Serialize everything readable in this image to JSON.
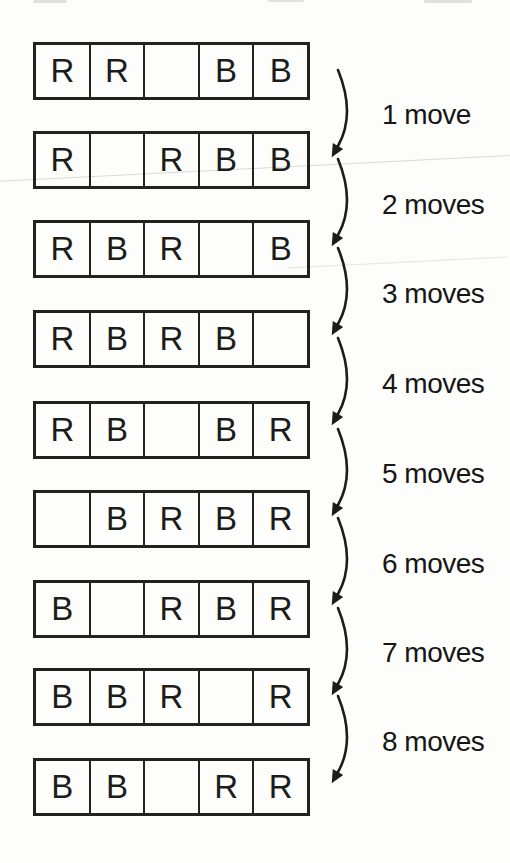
{
  "colors": {
    "background": "#fdfdfb",
    "ink": "#1c1c1a",
    "scan_artifact": "#d4d3cc"
  },
  "board_rows": [
    {
      "cells": [
        "R",
        "R",
        "",
        "B",
        "B"
      ]
    },
    {
      "cells": [
        "R",
        "",
        "R",
        "B",
        "B"
      ]
    },
    {
      "cells": [
        "R",
        "B",
        "R",
        "",
        "B"
      ]
    },
    {
      "cells": [
        "R",
        "B",
        "R",
        "B",
        ""
      ]
    },
    {
      "cells": [
        "R",
        "B",
        "",
        "B",
        "R"
      ]
    },
    {
      "cells": [
        "",
        "B",
        "R",
        "B",
        "R"
      ]
    },
    {
      "cells": [
        "B",
        "",
        "R",
        "B",
        "R"
      ]
    },
    {
      "cells": [
        "B",
        "B",
        "R",
        "",
        "R"
      ]
    },
    {
      "cells": [
        "B",
        "B",
        "",
        "R",
        "R"
      ]
    }
  ],
  "transitions": [
    {
      "label": "1 move"
    },
    {
      "label": "2 moves"
    },
    {
      "label": "3 moves"
    },
    {
      "label": "4 moves"
    },
    {
      "label": "5 moves"
    },
    {
      "label": "6 moves"
    },
    {
      "label": "7 moves"
    },
    {
      "label": "8 moves"
    }
  ]
}
